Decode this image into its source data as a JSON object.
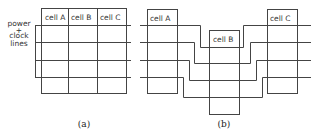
{
  "panel_a": {
    "caption": "(a)",
    "side_label": [
      "power",
      "+",
      "clock",
      "lines"
    ],
    "cells": [
      "cell A",
      "cell B",
      "cell C"
    ]
  },
  "panel_b": {
    "caption": "(b)",
    "cells": [
      "cell A",
      "cell B",
      "cell C"
    ]
  }
}
